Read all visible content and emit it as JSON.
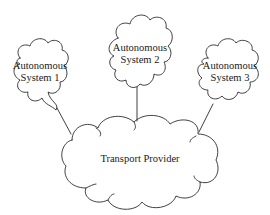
{
  "diagram": {
    "type": "network-topology",
    "nodes": [
      {
        "id": "as1",
        "line1": "Autonomous",
        "line2": "System 1",
        "x": 40,
        "y": 72
      },
      {
        "id": "as2",
        "line1": "Autonomous",
        "line2": "System 2",
        "x": 140,
        "y": 54
      },
      {
        "id": "as3",
        "line1": "Autonomous",
        "line2": "System 3",
        "x": 230,
        "y": 72
      },
      {
        "id": "transport",
        "label": "Transport Provider",
        "x": 140,
        "y": 159
      }
    ],
    "edges": [
      {
        "from": "as1",
        "to": "transport"
      },
      {
        "from": "as2",
        "to": "transport"
      },
      {
        "from": "as3",
        "to": "transport"
      }
    ],
    "colors": {
      "stroke": "#2a2a2a",
      "background": "#ffffff",
      "text": "#1a1a1a"
    }
  }
}
